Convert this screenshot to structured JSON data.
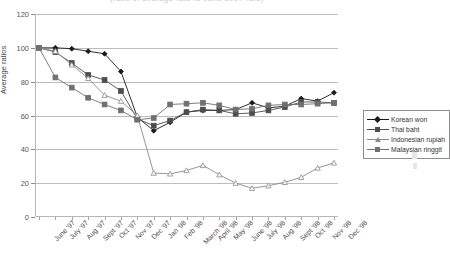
{
  "figure": {
    "cropped_title": "(ratio of average rate to June 1997 rate)",
    "y_axis_title": "Average ratios"
  },
  "legend": {
    "position": "right",
    "items": [
      {
        "label": "Korean won",
        "color": "#1a1a1a",
        "marker": "diamond"
      },
      {
        "label": "Thai baht",
        "color": "#4d4d4d",
        "marker": "square"
      },
      {
        "label": "Indonesian rupiah",
        "color": "#8a8a8a",
        "marker": "triangle"
      },
      {
        "label": "Malaysian ringgit",
        "color": "#707070",
        "marker": "square"
      }
    ]
  },
  "axis": {
    "y_ticks": [
      "0",
      "20",
      "40",
      "60",
      "80",
      "100",
      "120"
    ],
    "x_ticks": [
      "June '97",
      "July '97",
      "Aug '97",
      "Sept '97",
      "Oct '97",
      "Nov '97",
      "Dec '97",
      "Jan '98",
      "Feb '98",
      "March '98",
      "April '98",
      "May '98",
      "June '98",
      "July '98",
      "Aug '98",
      "Sept '98",
      "Oct '98",
      "Nov '98",
      "Dec '98"
    ]
  },
  "chart_data": {
    "type": "line",
    "title": "(ratio of average rate to June 1997 rate)",
    "xlabel": "",
    "ylabel": "Average ratios",
    "ylim": [
      0,
      120
    ],
    "ytick_step": 20,
    "grid": true,
    "legend_position": "right",
    "categories": [
      "June '97",
      "July '97",
      "Aug '97",
      "Sept '97",
      "Oct '97",
      "Nov '97",
      "Dec '97",
      "Jan '98",
      "Feb '98",
      "March '98",
      "April '98",
      "May '98",
      "June '98",
      "July '98",
      "Aug '98",
      "Sept '98",
      "Oct '98",
      "Nov '98",
      "Dec '98"
    ],
    "series": [
      {
        "name": "Korean won",
        "color": "#1a1a1a",
        "marker": "diamond",
        "values": [
          100,
          100,
          99.5,
          98,
          96.5,
          86,
          59,
          51,
          56,
          62,
          63,
          63,
          63.5,
          67.5,
          64.5,
          65.5,
          70,
          68.5,
          73.5
        ]
      },
      {
        "name": "Thai baht",
        "color": "#4d4d4d",
        "marker": "square",
        "values": [
          100,
          97.5,
          91,
          84,
          81,
          74.5,
          58,
          54,
          57,
          62,
          63.5,
          63,
          61,
          61.5,
          63,
          65,
          68,
          68,
          67.5
        ]
      },
      {
        "name": "Indonesian rupiah",
        "color": "#8a8a8a",
        "marker": "triangle",
        "values": [
          100,
          98,
          90,
          82,
          72,
          68.5,
          60,
          26,
          25.5,
          27.5,
          30.5,
          25,
          20,
          17,
          18.5,
          20.5,
          23.5,
          29,
          32
        ]
      },
      {
        "name": "Malaysian ringgit",
        "color": "#707070",
        "marker": "square",
        "values": [
          100,
          82.5,
          76.5,
          70.5,
          66.5,
          63,
          57.5,
          58.5,
          66.5,
          67,
          67.5,
          66,
          63.5,
          64,
          66,
          66.5,
          66.5,
          67,
          67.5
        ]
      }
    ]
  }
}
